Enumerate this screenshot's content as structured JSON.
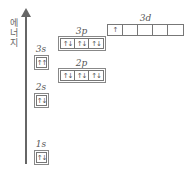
{
  "axis": {
    "label": "에\n너\n지",
    "label_chars": [
      "에",
      "너",
      "지"
    ]
  },
  "orbitals": [
    {
      "name": "1s",
      "cells": [
        "↑↓"
      ]
    },
    {
      "name": "2s",
      "cells": [
        "↑↓"
      ]
    },
    {
      "name": "2p",
      "cells": [
        "↑↓",
        "↑↓",
        "↑↓"
      ]
    },
    {
      "name": "3s",
      "cells": [
        "↑↑"
      ]
    },
    {
      "name": "3p",
      "cells": [
        "↑↓",
        "↑↓",
        "↑↓"
      ]
    },
    {
      "name": "3d",
      "cells": [
        "↑",
        "",
        "",
        "",
        ""
      ]
    }
  ]
}
